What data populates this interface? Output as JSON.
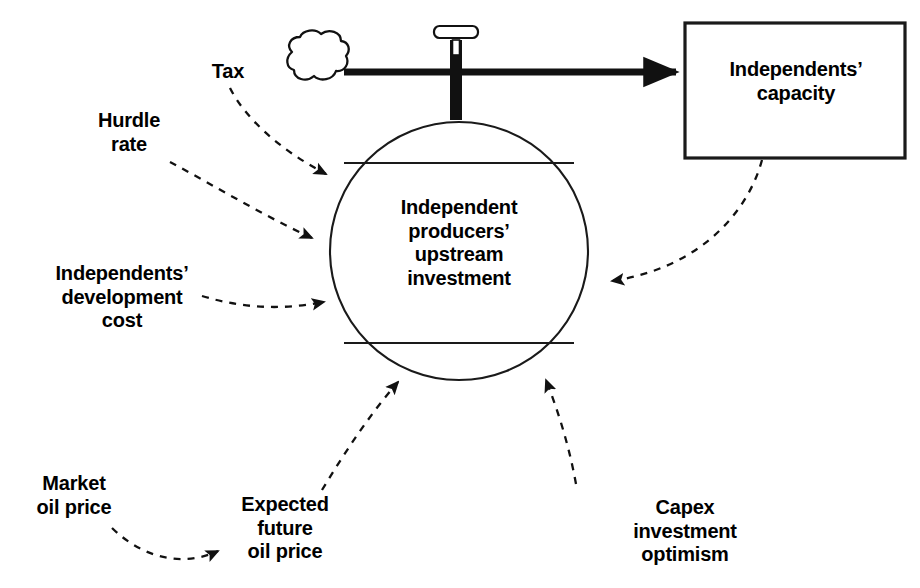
{
  "diagram": {
    "type": "stock-and-flow",
    "title_visible": false,
    "background_color": "#ffffff",
    "ink_color": "#000000",
    "stock": {
      "shape": "circle",
      "label": "Independent\nproducers’\nupstream\ninvestment",
      "chord_lines": 2
    },
    "box": {
      "shape": "rectangle",
      "label": "Independents’\ncapacity"
    },
    "source_cloud": {
      "name": "cloud-source",
      "label": ""
    },
    "valve": {
      "name": "flow-valve",
      "label": ""
    },
    "flow": {
      "name": "material-flow",
      "style": "solid-thick-arrow",
      "from": "cloud-source",
      "to": "Independents’ capacity"
    },
    "influences": [
      {
        "id": "tax",
        "label": "Tax",
        "target": "Independent producers’ upstream investment",
        "style": "dashed-arrow"
      },
      {
        "id": "hurdle-rate",
        "label": "Hurdle\nrate",
        "target": "Independent producers’ upstream investment",
        "style": "dashed-arrow"
      },
      {
        "id": "independents-development-cost",
        "label": "Independents’\ndevelopment\ncost",
        "target": "Independent producers’ upstream investment",
        "style": "dashed-arrow"
      },
      {
        "id": "market-oil-price",
        "label": "Market\noil price",
        "target": "Expected future oil price",
        "style": "dashed-arrow"
      },
      {
        "id": "expected-future-oil-price",
        "label": "Expected\nfuture\noil price",
        "target": "Independent producers’ upstream investment",
        "style": "dashed-arrow"
      },
      {
        "id": "capex-investment-optimism",
        "label": "Capex\ninvestment\noptimism",
        "target": "Independent producers’ upstream investment",
        "style": "dashed-arrow"
      },
      {
        "id": "capacity-feedback",
        "label": "",
        "source": "Independents’ capacity",
        "target": "Independent producers’ upstream investment",
        "style": "dashed-arrow"
      }
    ]
  }
}
